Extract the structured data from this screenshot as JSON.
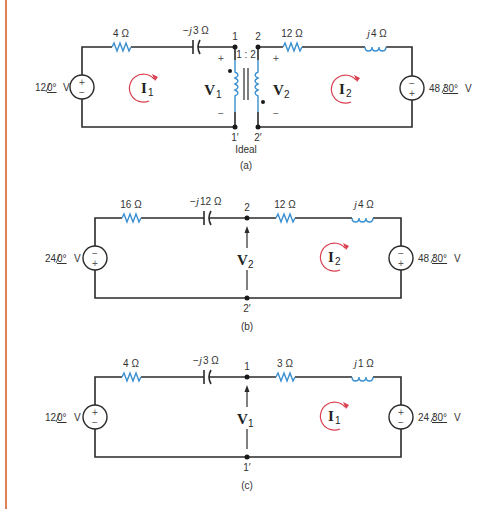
{
  "figure": {
    "margin_color": "#e0805a",
    "component_color": "#3a8fd0",
    "loop_color": "#d94050",
    "circuits": [
      {
        "id": "a",
        "caption": "(a)",
        "source_left": {
          "magnitude": "12",
          "angle": "0°",
          "unit": "V",
          "polarity_top": "+",
          "polarity_bottom": "−"
        },
        "resistor_left": "4 Ω",
        "capacitor": {
          "prefix": "−",
          "j": "j",
          "value": "3 Ω"
        },
        "node_top_left": "1",
        "node_bottom_left": "1′",
        "node_top_right": "2",
        "node_bottom_right": "2′",
        "transformer_ratio": "1 : 2",
        "transformer_label": "Ideal",
        "v1": {
          "symbol": "V",
          "sub": "1",
          "plus": "+",
          "minus": "−"
        },
        "v2": {
          "symbol": "V",
          "sub": "2",
          "plus": "+",
          "minus": "−"
        },
        "loop_left": {
          "symbol": "I",
          "sub": "1"
        },
        "loop_right": {
          "symbol": "I",
          "sub": "2"
        },
        "resistor_right": "12 Ω",
        "inductor": {
          "j": "j",
          "value": "4 Ω"
        },
        "source_right": {
          "magnitude": "48",
          "angle": "30°",
          "unit": "V",
          "polarity_top": "−",
          "polarity_bottom": "+"
        }
      },
      {
        "id": "b",
        "caption": "(b)",
        "source_left": {
          "magnitude": "24",
          "angle": "0°",
          "unit": "V",
          "polarity_top": "−",
          "polarity_bottom": "+"
        },
        "resistor_left": "16 Ω",
        "capacitor": {
          "prefix": "−",
          "j": "j",
          "value": "12 Ω"
        },
        "node_top": "2",
        "node_bottom": "2′",
        "voltage": {
          "symbol": "V",
          "sub": "2"
        },
        "loop": {
          "symbol": "I",
          "sub": "2"
        },
        "resistor_right": "12 Ω",
        "inductor": {
          "j": "j",
          "value": "4 Ω"
        },
        "source_right": {
          "magnitude": "48",
          "angle": "30°",
          "unit": "V",
          "polarity_top": "−",
          "polarity_bottom": "+"
        }
      },
      {
        "id": "c",
        "caption": "(c)",
        "source_left": {
          "magnitude": "12",
          "angle": "0°",
          "unit": "V",
          "polarity_top": "+",
          "polarity_bottom": "−"
        },
        "resistor_left": "4 Ω",
        "capacitor": {
          "prefix": "−",
          "j": "j",
          "value": "3 Ω"
        },
        "node_top": "1",
        "node_bottom": "1′",
        "voltage": {
          "symbol": "V",
          "sub": "1"
        },
        "loop": {
          "symbol": "I",
          "sub": "1"
        },
        "resistor_right": "3 Ω",
        "inductor": {
          "j": "j",
          "value": "1 Ω"
        },
        "source_right": {
          "magnitude": "24",
          "angle": "30°",
          "unit": "V",
          "polarity_top": "+",
          "polarity_bottom": "−"
        }
      }
    ]
  }
}
